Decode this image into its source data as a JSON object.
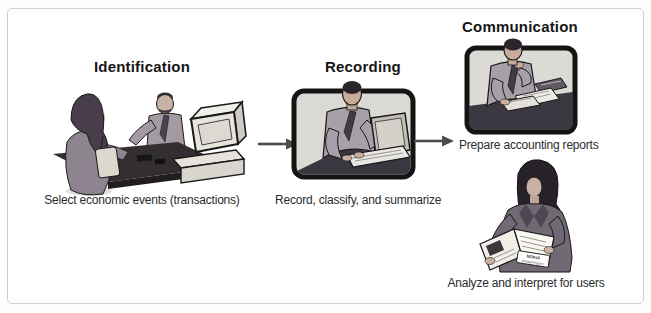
{
  "figure": {
    "colors": {
      "panel_border": "#cdd0cb",
      "title_text": "#161616",
      "caption_text": "#2b2b2b",
      "arrow": "#4c4c4c",
      "frame_border": "#141414",
      "frame_fill": "#dbd9d4"
    }
  },
  "steps": {
    "identification": {
      "title": "Identification",
      "caption": "Select economic events (transactions)",
      "illustration": "clerk-and-customer-at-sales-counter"
    },
    "recording": {
      "title": "Recording",
      "caption": "Record, classify, and summarize",
      "illustration": "man-typing-on-laptop"
    },
    "communication": {
      "title": "Communication",
      "caption_reports": "Prepare accounting reports",
      "illustration_reports": "man-preparing-reports-at-desk",
      "caption_analyze": "Analyze and interpret for users",
      "illustration_analyze": "woman-reading-annual-report",
      "booklet": {
        "line1": "NOKIA",
        "line2": "Annual Report"
      }
    }
  }
}
